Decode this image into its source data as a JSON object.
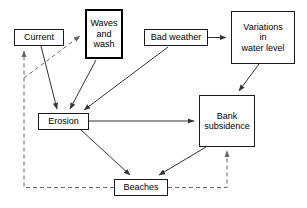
{
  "diagram": {
    "type": "flow-diagram",
    "colors": {
      "background": "#ffffff",
      "node_border": "#1a1a1a",
      "emphasis_border": "#000000",
      "solid_edge": "#333333",
      "dashed_edge": "#666666",
      "text": "#000000"
    },
    "nodes": [
      {
        "id": "current",
        "label": "Current",
        "x": 14,
        "y": 29,
        "w": 50,
        "h": 17,
        "emphasis": false
      },
      {
        "id": "waves_and_wash",
        "label": "Waves\nand\nwash",
        "x": 85,
        "y": 9,
        "w": 38,
        "h": 50,
        "emphasis": true
      },
      {
        "id": "bad_weather",
        "label": "Bad weather",
        "x": 144,
        "y": 29,
        "w": 64,
        "h": 17,
        "emphasis": false
      },
      {
        "id": "variations_in_water_level",
        "label": "Variations\nin\nwater level",
        "x": 231,
        "y": 11,
        "w": 64,
        "h": 53,
        "emphasis": false
      },
      {
        "id": "erosion",
        "label": "Erosion",
        "x": 38,
        "y": 113,
        "w": 51,
        "h": 17,
        "emphasis": false
      },
      {
        "id": "bank_subsidence",
        "label": "Bank\nsubsidence",
        "x": 199,
        "y": 95,
        "w": 56,
        "h": 52,
        "emphasis": false
      },
      {
        "id": "beaches",
        "label": "Beaches",
        "x": 114,
        "y": 179,
        "w": 54,
        "h": 17,
        "emphasis": false
      }
    ],
    "edges": [
      {
        "id": "current-to-erosion",
        "from": "current",
        "to": "erosion",
        "style": "solid",
        "arrow": true
      },
      {
        "id": "waves-to-erosion",
        "from": "waves_and_wash",
        "to": "erosion",
        "style": "solid",
        "arrow": true
      },
      {
        "id": "bad-weather-to-erosion",
        "from": "bad_weather",
        "to": "erosion",
        "style": "solid",
        "arrow": true
      },
      {
        "id": "bad-weather-to-variations",
        "from": "bad_weather",
        "to": "variations_in_water_level",
        "style": "solid",
        "arrow": true
      },
      {
        "id": "variations-to-bank-subsidence",
        "from": "variations_in_water_level",
        "to": "bank_subsidence",
        "style": "solid",
        "arrow": true
      },
      {
        "id": "erosion-to-bank-subsidence",
        "from": "erosion",
        "to": "bank_subsidence",
        "style": "solid",
        "arrow": true
      },
      {
        "id": "erosion-to-beaches",
        "from": "erosion",
        "to": "beaches",
        "style": "solid",
        "arrow": true
      },
      {
        "id": "bank-subsidence-to-beaches",
        "from": "bank_subsidence",
        "to": "beaches",
        "style": "solid",
        "arrow": true
      },
      {
        "id": "beaches-to-current",
        "from": "beaches",
        "to": "current",
        "style": "dashed",
        "arrow": true
      },
      {
        "id": "beaches-to-waves",
        "from": "beaches",
        "to": "waves_and_wash",
        "style": "dashed",
        "arrow": true
      },
      {
        "id": "beaches-to-bank-subsidence",
        "from": "beaches",
        "to": "bank_subsidence",
        "style": "dashed",
        "arrow": true
      }
    ]
  }
}
